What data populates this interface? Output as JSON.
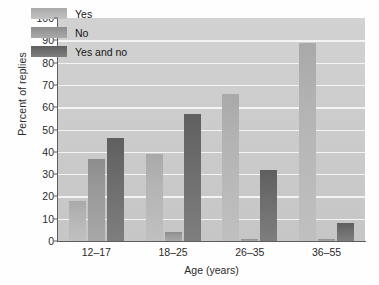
{
  "chart_data": {
    "type": "bar",
    "title": "",
    "xlabel": "Age (years)",
    "ylabel": "Percent of replies",
    "categories": [
      "12–17",
      "18–25",
      "26–35",
      "36–55"
    ],
    "series": [
      {
        "name": "Yes",
        "values": [
          18,
          39,
          66,
          89
        ]
      },
      {
        "name": "No",
        "values": [
          37,
          4,
          1,
          1
        ]
      },
      {
        "name": "Yes and no",
        "values": [
          46,
          57,
          32,
          8
        ]
      }
    ],
    "ylim": [
      0,
      100
    ],
    "yticks": [
      0,
      10,
      20,
      30,
      40,
      50,
      60,
      70,
      80,
      90,
      100
    ],
    "ytick_labels": [
      "0",
      "10",
      "20",
      "30",
      "40",
      "50",
      "60",
      "70",
      "80",
      "90",
      "100"
    ],
    "grid": true,
    "grid_axis": "y",
    "legend_position": "top-left-inside",
    "colors": {
      "series_yes": "#b4b4b4",
      "series_no": "#9a9a9a",
      "series_yes_and_no": "#6e6e6e",
      "plot_background": "#cccccc",
      "gridline": "#f4f4f4",
      "axis": "#5e5e5e",
      "text": "#2b2b2b"
    }
  }
}
